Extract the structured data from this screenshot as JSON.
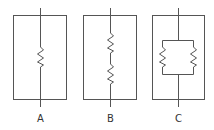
{
  "diagram": {
    "title": "",
    "stroke_color": "#555555",
    "circuits": [
      {
        "label": "A",
        "type": "single-resistor"
      },
      {
        "label": "B",
        "type": "series-resistors"
      },
      {
        "label": "C",
        "type": "parallel-resistors"
      }
    ]
  }
}
